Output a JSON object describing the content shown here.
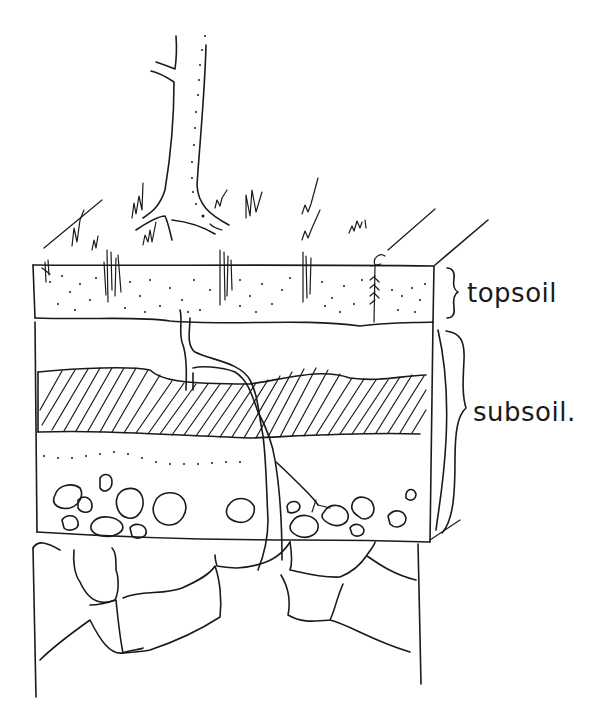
{
  "diagram": {
    "ink_color": "#1a1a1a",
    "background": "#ffffff",
    "labels": {
      "topsoil": "topsoil",
      "subsoil": "subsoil."
    },
    "layers": [
      {
        "name": "surface",
        "contents": "grass tufts, tree trunk with roots, small plant"
      },
      {
        "name": "topsoil",
        "pattern": "stippled dots"
      },
      {
        "name": "subsoil-upper",
        "pattern": "blank"
      },
      {
        "name": "subsoil-hatched-band",
        "pattern": "diagonal hatching"
      },
      {
        "name": "subsoil-dotted",
        "pattern": "sparse dots"
      },
      {
        "name": "subsoil-stones",
        "pattern": "rounded pebbles"
      },
      {
        "name": "bedrock",
        "pattern": "large blocky rocks"
      }
    ]
  }
}
